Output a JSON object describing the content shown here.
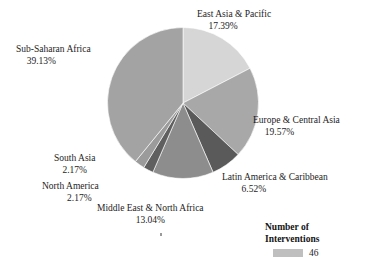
{
  "chart_data": {
    "type": "pie",
    "title": "",
    "categories": [
      "East Asia & Pacific",
      "Europe & Central Asia",
      "Latin America & Caribbean",
      "Middle East & North Africa",
      "North America",
      "South Asia",
      "Sub-Saharan Africa"
    ],
    "values": [
      17.39,
      19.57,
      6.52,
      13.04,
      2.17,
      2.17,
      39.13
    ],
    "value_unit": "%",
    "counts": [
      8,
      9,
      3,
      6,
      1,
      1,
      18
    ],
    "total": 46,
    "start_angle_deg": 0,
    "direction": "clockwise",
    "legend_position": "bottom-right",
    "grid": false,
    "slices": [
      {
        "label": "East Asia & Pacific",
        "percent_text": "17.39%",
        "value": 17.39,
        "color": "#d6d6d6"
      },
      {
        "label": "Europe & Central Asia",
        "percent_text": "19.57%",
        "value": 19.57,
        "color": "#a8a8a8"
      },
      {
        "label": "Latin America & Caribbean",
        "percent_text": "6.52%",
        "value": 6.52,
        "color": "#5a5a5a"
      },
      {
        "label": "Middle East & North Africa",
        "percent_text": "13.04%",
        "value": 13.04,
        "color": "#8d8d8d"
      },
      {
        "label": "North America",
        "percent_text": "2.17%",
        "value": 2.17,
        "color": "#5f5f5f"
      },
      {
        "label": "South Asia",
        "percent_text": "2.17%",
        "value": 2.17,
        "color": "#9b9b9b"
      },
      {
        "label": "Sub-Saharan Africa",
        "percent_text": "39.13%",
        "value": 39.13,
        "color": "#a3a3a3"
      }
    ]
  },
  "legend": {
    "title_line1": "Number of",
    "title_line2": "Interventions",
    "swatch_color": "#bfbfbf",
    "value": "46"
  }
}
